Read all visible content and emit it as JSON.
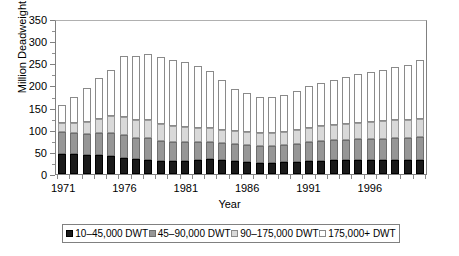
{
  "chart_data": {
    "type": "bar",
    "stacked": true,
    "title": "",
    "xlabel": "Year",
    "ylabel": "Million Deadweight Tons",
    "ylim": [
      0,
      350
    ],
    "ytick_step": 50,
    "yticks": [
      0,
      50,
      100,
      150,
      200,
      250,
      300,
      350
    ],
    "grid": false,
    "legend_position": "bottom",
    "xtick_labels": [
      "1971",
      "1976",
      "1981",
      "1986",
      "1991",
      "1996"
    ],
    "categories": [
      "1971",
      "1972",
      "1973",
      "1974",
      "1975",
      "1976",
      "1977",
      "1978",
      "1979",
      "1980",
      "1981",
      "1982",
      "1983",
      "1984",
      "1985",
      "1986",
      "1987",
      "1988",
      "1989",
      "1990",
      "1991",
      "1992",
      "1993",
      "1994",
      "1995",
      "1996",
      "1997",
      "1998",
      "1999",
      "2000"
    ],
    "series": [
      {
        "name": "10–45,000 DWT",
        "color": "#1a1a1a",
        "values": [
          45,
          45,
          43,
          42,
          41,
          37,
          33,
          32,
          29,
          29,
          29,
          31,
          33,
          31,
          30,
          28,
          26,
          26,
          27,
          28,
          30,
          30,
          31,
          31,
          32,
          31,
          31,
          31,
          31,
          31
        ]
      },
      {
        "name": "45–90,000 DWT",
        "color": "#969696",
        "values": [
          50,
          48,
          48,
          50,
          52,
          52,
          49,
          49,
          45,
          43,
          43,
          42,
          40,
          39,
          38,
          38,
          37,
          37,
          38,
          40,
          42,
          44,
          45,
          46,
          47,
          48,
          49,
          50,
          51,
          52
        ]
      },
      {
        "name": "90–175,000 DWT",
        "color": "#d9d9d9",
        "values": [
          20,
          22,
          26,
          32,
          37,
          39,
          40,
          40,
          38,
          36,
          34,
          32,
          31,
          30,
          30,
          30,
          30,
          30,
          31,
          32,
          33,
          34,
          35,
          36,
          37,
          38,
          39,
          40,
          41,
          42
        ]
      },
      {
        "name": "175,000+ DWT",
        "color": "#ffffff",
        "values": [
          40,
          60,
          78,
          92,
          104,
          138,
          145,
          150,
          152,
          150,
          146,
          140,
          128,
          112,
          95,
          86,
          80,
          80,
          83,
          88,
          93,
          97,
          101,
          105,
          109,
          113,
          116,
          120,
          124,
          132
        ]
      }
    ],
    "totals": [
      155,
      175,
      195,
      216,
      234,
      266,
      267,
      271,
      264,
      258,
      252,
      245,
      232,
      212,
      193,
      182,
      173,
      173,
      179,
      188,
      198,
      205,
      212,
      218,
      225,
      230,
      235,
      241,
      247,
      257
    ]
  },
  "legend": {
    "items": [
      {
        "label": "10–45,000 DWT"
      },
      {
        "label": "45–90,000 DWT"
      },
      {
        "label": "90–175,000 DWT"
      },
      {
        "label": "175,000+ DWT"
      }
    ]
  }
}
